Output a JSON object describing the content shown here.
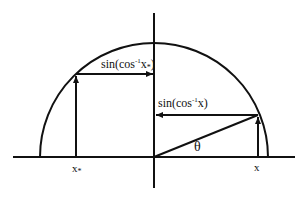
{
  "diagram": {
    "type": "unit-semicircle-inverse-trig",
    "labels": {
      "sin_cos_inv_xstar": {
        "prefix": "sin(cos",
        "superscript": "-1",
        "var": "x",
        "subscript": "*",
        "suffix": ")"
      },
      "sin_cos_inv_x": {
        "prefix": "sin(cos",
        "superscript": "-1",
        "var": "x",
        "suffix": ")"
      },
      "theta": "θ",
      "x_star": {
        "var": "x",
        "subscript": "*"
      },
      "x": "x"
    },
    "colors": {
      "stroke": "#111111",
      "background": "#ffffff"
    }
  }
}
